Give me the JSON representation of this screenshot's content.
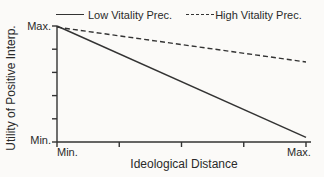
{
  "chart_data": {
    "type": "line",
    "xlabel": "Ideological Distance",
    "ylabel": "Utility of Positive Interp.",
    "x_tick_labels": [
      "Min.",
      "Max."
    ],
    "y_tick_labels": [
      "Max.",
      "Min."
    ],
    "x_range": [
      0,
      1
    ],
    "y_range": [
      0,
      1
    ],
    "x_tick_count": 5,
    "y_tick_count": 6,
    "grid": "off",
    "legend_position": "top",
    "series": [
      {
        "name": "Low Vitality Prec.",
        "style": "solid",
        "x": [
          0,
          1
        ],
        "y": [
          1.0,
          0.04
        ]
      },
      {
        "name": "High Vitality Prec.",
        "style": "dashed",
        "x": [
          0,
          1
        ],
        "y": [
          0.99,
          0.69
        ]
      }
    ]
  },
  "colors": {
    "line": "#333333",
    "text": "#2a2a2a",
    "background": "#fbfaf8"
  }
}
